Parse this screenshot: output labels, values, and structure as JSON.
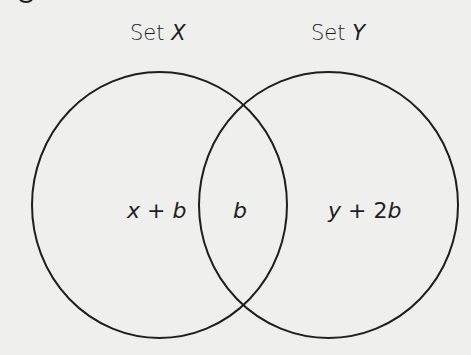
{
  "diagram": {
    "type": "venn",
    "colors": {
      "stroke": "#1e1e1e",
      "background": "#efefed"
    },
    "sets": [
      {
        "id": "X",
        "title_prefix": "Set ",
        "title_var": "X",
        "region_label": "x + b"
      },
      {
        "id": "Y",
        "title_prefix": "Set ",
        "title_var": "Y",
        "region_label": "y + 2b"
      }
    ],
    "intersection_label": "b"
  },
  "labels": {
    "set_x_prefix": "Set ",
    "set_x_var": "X",
    "set_y_prefix": "Set ",
    "set_y_var": "Y",
    "only_x_var": "x",
    "only_x_op": " + ",
    "only_x_term": "b",
    "intersection": "b",
    "only_y_var": "y",
    "only_y_op": " + ",
    "only_y_coef": "2",
    "only_y_term": "b"
  }
}
